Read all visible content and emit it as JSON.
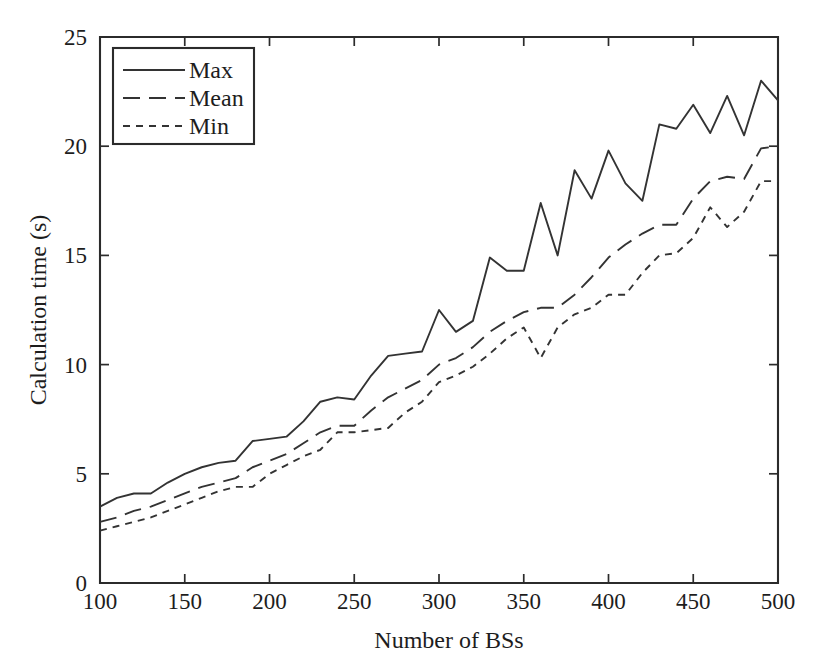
{
  "chart_data": {
    "type": "line",
    "title": "",
    "xlabel": "Number of BSs",
    "ylabel": "Calculation time (s)",
    "xlim": [
      100,
      500
    ],
    "ylim": [
      0,
      25
    ],
    "xticks": [
      100,
      150,
      200,
      250,
      300,
      350,
      400,
      450,
      500
    ],
    "xtick_labels": [
      "100",
      "150",
      "200",
      "250",
      "300",
      "350",
      "400",
      "450",
      "500"
    ],
    "yticks": [
      0,
      5,
      10,
      15,
      20,
      25
    ],
    "ytick_labels": [
      "0",
      "5",
      "10",
      "15",
      "20",
      "25"
    ],
    "grid": false,
    "legend_position": "upper left",
    "x": [
      100,
      110,
      120,
      130,
      140,
      150,
      160,
      170,
      180,
      190,
      200,
      210,
      220,
      230,
      240,
      250,
      260,
      270,
      280,
      290,
      300,
      310,
      320,
      330,
      340,
      350,
      360,
      370,
      380,
      390,
      400,
      410,
      420,
      430,
      440,
      450,
      460,
      470,
      480,
      490,
      500
    ],
    "series": [
      {
        "name": "Max",
        "style": "solid",
        "values": [
          3.5,
          3.9,
          4.1,
          4.1,
          4.6,
          5.0,
          5.3,
          5.5,
          5.6,
          6.5,
          6.6,
          6.7,
          7.4,
          8.3,
          8.5,
          8.4,
          9.5,
          10.4,
          10.5,
          10.6,
          12.5,
          11.5,
          12.0,
          14.9,
          14.3,
          14.3,
          17.4,
          15.0,
          18.9,
          17.6,
          19.8,
          18.3,
          17.5,
          21.0,
          20.8,
          21.9,
          20.6,
          22.3,
          20.5,
          23.0,
          22.1
        ]
      },
      {
        "name": "Mean",
        "style": "dashed-long",
        "values": [
          2.8,
          3.0,
          3.3,
          3.5,
          3.8,
          4.1,
          4.4,
          4.6,
          4.8,
          5.3,
          5.6,
          5.9,
          6.4,
          6.9,
          7.2,
          7.2,
          7.9,
          8.5,
          8.9,
          9.3,
          10.0,
          10.3,
          10.8,
          11.5,
          12.0,
          12.4,
          12.6,
          12.6,
          13.2,
          14.0,
          14.9,
          15.5,
          16.0,
          16.4,
          16.4,
          17.6,
          18.4,
          18.6,
          18.5,
          19.9,
          20.0
        ]
      },
      {
        "name": "Min",
        "style": "dashed-short",
        "values": [
          2.4,
          2.6,
          2.8,
          3.0,
          3.3,
          3.6,
          3.9,
          4.2,
          4.4,
          4.4,
          5.0,
          5.4,
          5.8,
          6.1,
          6.9,
          6.9,
          7.0,
          7.1,
          7.8,
          8.3,
          9.2,
          9.5,
          9.9,
          10.5,
          11.2,
          11.7,
          10.3,
          11.7,
          12.3,
          12.6,
          13.2,
          13.2,
          14.2,
          15.0,
          15.1,
          15.8,
          17.2,
          16.3,
          17.0,
          18.4,
          18.4
        ]
      }
    ],
    "legend": [
      {
        "label": "Max",
        "style": "solid"
      },
      {
        "label": "Mean",
        "style": "dashed-long"
      },
      {
        "label": "Min",
        "style": "dashed-short"
      }
    ]
  }
}
